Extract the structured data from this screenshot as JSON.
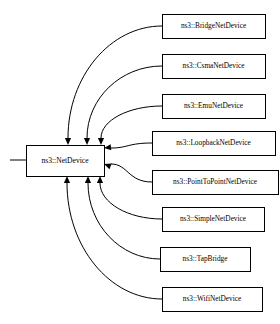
{
  "diagram": {
    "type": "uml-inheritance",
    "base": {
      "id": "netdevice",
      "label": "ns3::NetDevice",
      "x": 26,
      "y": 145,
      "width": 78,
      "height": 31
    },
    "derived": [
      {
        "id": "bridge",
        "label": "ns3::BridgeNetDevice",
        "x": 162,
        "y": 14,
        "width": 103,
        "height": 24,
        "arrow_target": "top",
        "anchor_x": 68,
        "anchor_y": 145
      },
      {
        "id": "csma",
        "label": "ns3::CsmaNetDevice",
        "x": 162,
        "y": 54,
        "width": 103,
        "height": 24,
        "arrow_target": "top",
        "anchor_x": 87,
        "anchor_y": 145
      },
      {
        "id": "emu",
        "label": "ns3::EmuNetDevice",
        "x": 162,
        "y": 94,
        "width": 103,
        "height": 24,
        "arrow_target": "top",
        "anchor_x": 101,
        "anchor_y": 145
      },
      {
        "id": "loopback",
        "label": "ns3::LoopbackNetDevice",
        "x": 152,
        "y": 131,
        "width": 123,
        "height": 24,
        "arrow_target": "right",
        "anchor_x": 104,
        "anchor_y": 148
      },
      {
        "id": "pointtopoint",
        "label": "ns3::PointToPointNetDevice",
        "x": 152,
        "y": 170,
        "width": 126,
        "height": 24,
        "arrow_target": "right",
        "anchor_x": 104,
        "anchor_y": 164
      },
      {
        "id": "simple",
        "label": "ns3::SimpleNetDevice",
        "x": 162,
        "y": 207,
        "width": 102,
        "height": 24,
        "arrow_target": "bottom",
        "anchor_x": 100,
        "anchor_y": 176
      },
      {
        "id": "tapbridge",
        "label": "ns3::TapBridge",
        "x": 160,
        "y": 247,
        "width": 90,
        "height": 24,
        "arrow_target": "bottom",
        "anchor_x": 88,
        "anchor_y": 176
      },
      {
        "id": "wifi",
        "label": "ns3::WifiNetDevice",
        "x": 162,
        "y": 287,
        "width": 100,
        "height": 24,
        "arrow_target": "bottom",
        "anchor_x": 67,
        "anchor_y": 176
      }
    ],
    "root_stub": {
      "x1": 10,
      "y1": 160,
      "x2": 26,
      "y2": 160
    },
    "colors": {
      "background": "#ffffff",
      "box_fill": "#ffffff",
      "box_stroke": "#000000",
      "edge_stroke": "#000000",
      "text": "#000000"
    }
  }
}
